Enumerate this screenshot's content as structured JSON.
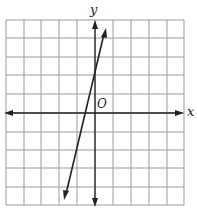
{
  "graph": {
    "axis_labels": {
      "x": "x",
      "y": "y",
      "origin": "O"
    },
    "grid": {
      "x_min": -5,
      "x_max": 5,
      "y_min": -5,
      "y_max": 5,
      "step": 1
    },
    "line": {
      "slope": 4,
      "y_intercept": 2,
      "equation": "y = 4x + 2"
    },
    "colors": {
      "grid": "#9a9a9a",
      "axis": "#222222",
      "line": "#222222",
      "border": "#9a9a9a"
    }
  },
  "chart_data": {
    "type": "line",
    "title": "",
    "xlabel": "x",
    "ylabel": "y",
    "xlim": [
      -5,
      5
    ],
    "ylim": [
      -5,
      5
    ],
    "grid": true,
    "series": [
      {
        "name": "line",
        "x": [
          -1.75,
          1.25
        ],
        "y": [
          -5,
          7
        ],
        "equation": "y = 4x + 2"
      }
    ]
  }
}
